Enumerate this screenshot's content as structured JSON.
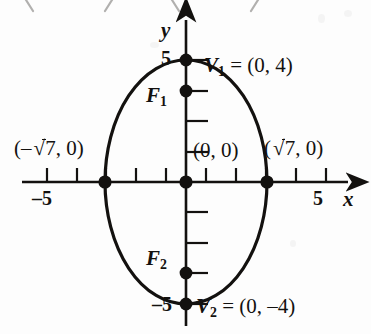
{
  "figure": {
    "type": "ellipse-graph"
  },
  "axes": {
    "x_label": "x",
    "y_label": "y",
    "x_ticks": [
      {
        "value": -5,
        "label": "–5",
        "show_label": true
      },
      {
        "value": -4,
        "label": "",
        "show_label": false
      },
      {
        "value": -3,
        "label": "",
        "show_label": false
      },
      {
        "value": -2,
        "label": "",
        "show_label": false
      },
      {
        "value": -1,
        "label": "",
        "show_label": false
      },
      {
        "value": 1,
        "label": "",
        "show_label": false
      },
      {
        "value": 2,
        "label": "",
        "show_label": false
      },
      {
        "value": 3,
        "label": "",
        "show_label": false
      },
      {
        "value": 4,
        "label": "",
        "show_label": false
      },
      {
        "value": 5,
        "label": "5",
        "show_label": true
      }
    ],
    "y_ticks": [
      {
        "value": 5,
        "label": "5",
        "show_label": true
      },
      {
        "value": 4,
        "label": "",
        "show_label": false
      },
      {
        "value": 3,
        "label": "",
        "show_label": false
      },
      {
        "value": 2,
        "label": "",
        "show_label": false
      },
      {
        "value": 1,
        "label": "",
        "show_label": false
      },
      {
        "value": -1,
        "label": "",
        "show_label": false
      },
      {
        "value": -2,
        "label": "",
        "show_label": false
      },
      {
        "value": -3,
        "label": "",
        "show_label": false
      },
      {
        "value": -4,
        "label": "",
        "show_label": false
      },
      {
        "value": -5,
        "label": "–5",
        "show_label": true
      }
    ],
    "x_tick_label_low": "–5",
    "x_tick_label_high": "5",
    "y_tick_label_high": "5",
    "y_tick_label_low": "–5"
  },
  "curve": {
    "kind": "ellipse",
    "center": [
      0,
      0
    ],
    "semi_axis_x": 2.6457513,
    "semi_axis_y": 4,
    "semi_axis_x_text": "√7",
    "semi_axis_y_text": "4"
  },
  "points": [
    {
      "id": "vertex-top",
      "label_text": "V",
      "sub": "1",
      "coords": "(0, 4)",
      "equals": "=",
      "x": 0,
      "y": 4
    },
    {
      "id": "focus-top",
      "label_text": "F",
      "sub": "1",
      "coords": "",
      "equals": "",
      "x": 0,
      "y": 3
    },
    {
      "id": "center",
      "label_text": "",
      "sub": "",
      "coords": "(0, 0)",
      "equals": "",
      "x": 0,
      "y": 0
    },
    {
      "id": "covertex-left",
      "label_text": "",
      "sub": "",
      "coords": "(–√7, 0)",
      "equals": "",
      "x": -2.6457513,
      "y": 0
    },
    {
      "id": "covertex-right",
      "label_text": "",
      "sub": "",
      "coords": "(√7, 0)",
      "equals": "",
      "x": 2.6457513,
      "y": 0
    },
    {
      "id": "focus-bottom",
      "label_text": "F",
      "sub": "2",
      "coords": "",
      "equals": "",
      "x": 0,
      "y": -3
    },
    {
      "id": "vertex-bottom",
      "label_text": "V",
      "sub": "2",
      "coords": "(0, –4)",
      "equals": "=",
      "x": 0,
      "y": -4
    }
  ],
  "labels": {
    "v1_name": "V",
    "v1_sub": "1",
    "v1_eq": "=",
    "v1_coords": "(0, 4)",
    "f1_name": "F",
    "f1_sub": "1",
    "origin": "(0, 0)",
    "covertex_left_open": "(–",
    "covertex_left_close": "7, 0)",
    "covertex_right_open": "(",
    "covertex_right_close": "7, 0)",
    "radical": "√",
    "f2_name": "F",
    "f2_sub": "2",
    "v2_name": "V",
    "v2_sub": "2",
    "v2_eq": "=",
    "v2_coords": "(0, –4)"
  },
  "colors": {
    "ink": "#13110f",
    "background": "#fdfdfd"
  }
}
